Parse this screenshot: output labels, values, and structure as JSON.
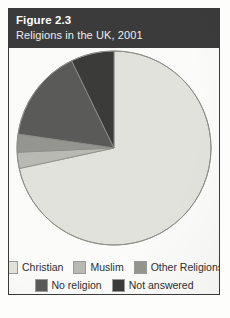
{
  "figure": {
    "number": "Figure 2.3",
    "title": "Religions in the UK, 2001"
  },
  "colors": {
    "caption_bar": "#3b3b3b",
    "page_background": "#fbfbf9",
    "border": "#3a3a3a",
    "slice_stroke": "#8d8d89",
    "christian": "#e2e2dd",
    "muslim": "#b9b9b3",
    "other_religions": "#949490",
    "no_religion": "#5a5a58",
    "not_answered": "#3b3b39"
  },
  "legend": {
    "rows": [
      [
        {
          "label": "Christian",
          "color_key": "christian"
        },
        {
          "label": "Muslim",
          "color_key": "muslim"
        },
        {
          "label": "Other Religions",
          "color_key": "other_religions"
        }
      ],
      [
        {
          "label": "No religion",
          "color_key": "no_religion"
        },
        {
          "label": "Not answered",
          "color_key": "not_answered"
        }
      ]
    ]
  },
  "chart_data": {
    "type": "pie",
    "title": "Religions in the UK, 2001",
    "xlabel": "",
    "ylabel": "",
    "legend_position": "bottom",
    "grid": false,
    "start_angle_deg": 90,
    "direction": "clockwise",
    "categories": [
      "Christian",
      "Muslim",
      "Other Religions",
      "No religion",
      "Not answered"
    ],
    "values": [
      71.6,
      2.7,
      3.0,
      15.5,
      7.2
    ],
    "unit": "percent",
    "slices": [
      {
        "label": "Christian",
        "value": 71.6,
        "color": "#e2e2dd"
      },
      {
        "label": "Muslim",
        "value": 2.7,
        "color": "#b9b9b3"
      },
      {
        "label": "Other Religions",
        "value": 3.0,
        "color": "#949490"
      },
      {
        "label": "No religion",
        "value": 15.5,
        "color": "#5a5a58"
      },
      {
        "label": "Not answered",
        "value": 7.2,
        "color": "#3b3b39"
      }
    ]
  }
}
